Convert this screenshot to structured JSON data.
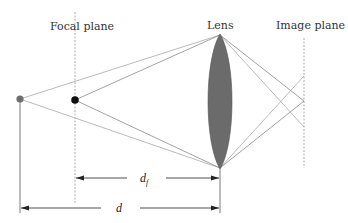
{
  "diagram": {
    "labels": {
      "focal_plane": "Focal plane",
      "lens": "Lens",
      "image_plane": "Image plane",
      "d_f_main": "d",
      "d_f_sub": "f",
      "d": "d"
    },
    "colors": {
      "lens_fill": "#6b6b6b",
      "far_point": "#6e6e6e",
      "focal_point": "#111111",
      "rays": "#999999",
      "dashed": "#9a9a9a",
      "arrows": "#222222"
    }
  }
}
